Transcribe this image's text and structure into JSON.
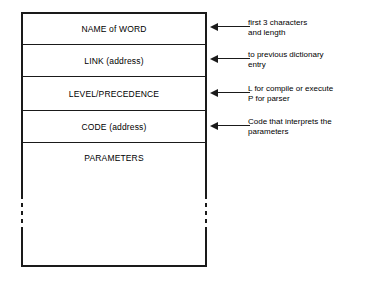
{
  "diagram": {
    "colors": {
      "background": "#ffffff",
      "line": "#1a1a1a",
      "text": "#000000"
    },
    "structure_box": {
      "fields": [
        {
          "id": "name-of-word",
          "label": "NAME of WORD",
          "top": 12,
          "height": 32,
          "annotation": {
            "arrow_icon": "arrow-left-icon",
            "lines": [
              "first 3 characters",
              "and length"
            ]
          }
        },
        {
          "id": "link-address",
          "label": "LINK (address)",
          "top": 44,
          "height": 32,
          "annotation": {
            "arrow_icon": "arrow-left-icon",
            "lines": [
              "to previous dictionary",
              "entry"
            ]
          }
        },
        {
          "id": "level-precedence",
          "label": "LEVEL/PRECEDENCE",
          "top": 76,
          "height": 34,
          "annotation": {
            "arrow_icon": "arrow-left-icon",
            "lines": [
              "L for compile or execute",
              "P for parser"
            ]
          }
        },
        {
          "id": "code-address",
          "label": "CODE (address)",
          "top": 110,
          "height": 32,
          "annotation": {
            "arrow_icon": "arrow-left-icon",
            "lines": [
              "Code that interprets the",
              "parameters"
            ]
          }
        },
        {
          "id": "parameters",
          "label": "PARAMETERS",
          "top": 142,
          "height": 125,
          "annotation": null
        }
      ]
    }
  }
}
